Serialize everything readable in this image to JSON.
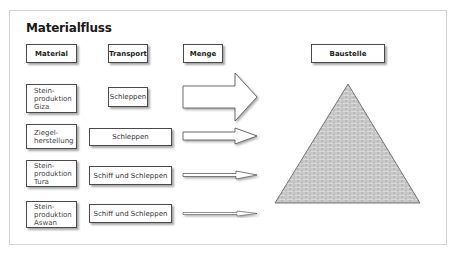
{
  "title": "Materialfluss",
  "headers": {
    "material": "Material",
    "transport": "Transport",
    "menge": "Menge",
    "baustelle": "Baustelle"
  },
  "rows": [
    {
      "material_lines": [
        "Stein-",
        "produktion",
        "Giza"
      ],
      "transport": "Schleppen",
      "arrow_size": "large"
    },
    {
      "material_lines": [
        "Ziegel-",
        "herstellung"
      ],
      "transport": "Schleppen",
      "arrow_size": "medium"
    },
    {
      "material_lines": [
        "Stein-",
        "produktion",
        "Tura"
      ],
      "transport": "Schiff und Schleppen",
      "arrow_size": "small"
    },
    {
      "material_lines": [
        "Stein-",
        "produktion",
        "Aswan"
      ],
      "transport": "Schiff und Schleppen",
      "arrow_size": "thin"
    }
  ],
  "colors": {
    "border": "#4a4a4a",
    "frame": "#d4d4d4",
    "brick_fill": "#d9d9d9",
    "brick_line": "#8a8a8a"
  }
}
